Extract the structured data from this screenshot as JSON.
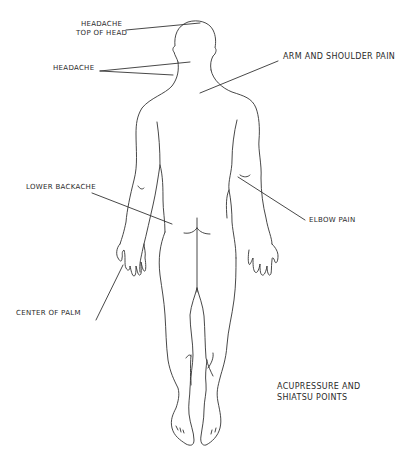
{
  "diagram": {
    "title_line1": "Acupressure and",
    "title_line2": "Shiatsu points",
    "figure": "human body outline, back view",
    "labels": [
      {
        "id": "headache-top",
        "line1": "Headache",
        "line2": "top of head"
      },
      {
        "id": "headache",
        "text": "Headache"
      },
      {
        "id": "arm-shoulder",
        "text": "Arm and shoulder pain"
      },
      {
        "id": "lower-backache",
        "text": "Lower backache"
      },
      {
        "id": "elbow",
        "text": "Elbow pain"
      },
      {
        "id": "palm",
        "text": "Center of palm"
      }
    ],
    "colors": {
      "background": "#ffffff",
      "ink": "#333333"
    }
  }
}
